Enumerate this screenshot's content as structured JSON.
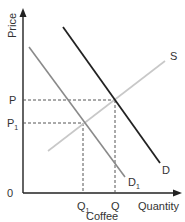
{
  "diagram": {
    "type": "supply-demand",
    "title": "",
    "x_axis": {
      "label": "Quantity",
      "caption": "Coffee",
      "origin_label": "0"
    },
    "y_axis": {
      "label": "Price"
    },
    "curves": [
      {
        "name": "S",
        "label": "S",
        "color": "#c8c8c8",
        "kind": "supply"
      },
      {
        "name": "D",
        "label": "D",
        "color": "#222222",
        "kind": "demand"
      },
      {
        "name": "D1",
        "label": "D",
        "label_sub": "1",
        "color": "#8a8a8a",
        "kind": "demand-shifted"
      }
    ],
    "price_levels": [
      {
        "label": "P",
        "sub": ""
      },
      {
        "label": "P",
        "sub": "1"
      }
    ],
    "quantity_levels": [
      {
        "label": "Q",
        "sub": "1"
      },
      {
        "label": "Q",
        "sub": ""
      }
    ],
    "colors": {
      "axis": "#222222",
      "guide": "#555555",
      "text": "#333333"
    }
  }
}
